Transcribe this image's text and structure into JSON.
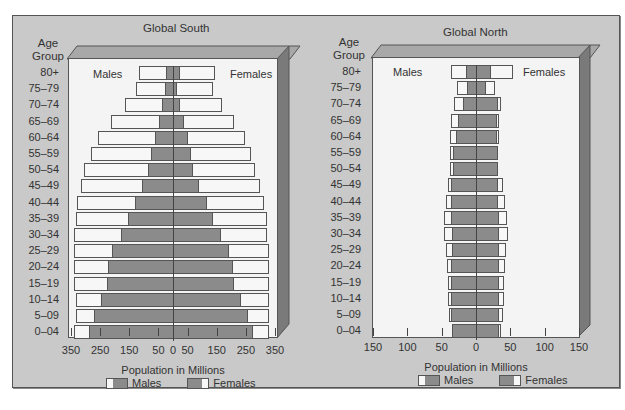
{
  "chart_data": [
    {
      "type": "bar",
      "subtype": "population-pyramid",
      "title": "Global South",
      "xlabel": "Population in Millions",
      "ylabel": "Age Group",
      "xlim": [
        -350,
        350
      ],
      "x_tick_labels": [
        "350",
        "250",
        "150",
        "50",
        "0",
        "50",
        "150",
        "250",
        "350"
      ],
      "x_tick_values": [
        -350,
        -250,
        -150,
        -50,
        0,
        50,
        150,
        250,
        350
      ],
      "grid": false,
      "side_labels": {
        "left": "Males",
        "right": "Females"
      },
      "legend": [
        "Males",
        "Females"
      ],
      "legend_position": "bottom",
      "categories": [
        "80+",
        "75-79",
        "70-74",
        "65-69",
        "60-64",
        "55-59",
        "50-54",
        "45-49",
        "40-44",
        "35-39",
        "30-34",
        "25-29",
        "20-24",
        "15-19",
        "10-14",
        "5-09",
        "0-04"
      ],
      "series": [
        {
          "name": "Males (outer, white)",
          "values": [
            116,
            126,
            164,
            212,
            259,
            280,
            307,
            314,
            328,
            334,
            338,
            338,
            341,
            341,
            334,
            334,
            341
          ]
        },
        {
          "name": "Males (inner, gray)",
          "values": [
            24,
            27,
            38,
            48,
            61,
            75,
            85,
            106,
            130,
            154,
            177,
            208,
            222,
            225,
            246,
            270,
            287
          ]
        },
        {
          "name": "Females (outer, white)",
          "values": [
            143,
            136,
            167,
            208,
            246,
            266,
            283,
            300,
            311,
            321,
            324,
            328,
            331,
            331,
            328,
            328,
            331
          ]
        },
        {
          "name": "Females (inner, gray)",
          "values": [
            24,
            14,
            24,
            38,
            51,
            61,
            68,
            89,
            116,
            136,
            164,
            191,
            205,
            208,
            232,
            259,
            273
          ]
        }
      ]
    },
    {
      "type": "bar",
      "subtype": "population-pyramid",
      "title": "Global North",
      "xlabel": "Population in Millions",
      "ylabel": "Age Group",
      "xlim": [
        -150,
        150
      ],
      "x_tick_labels": [
        "150",
        "100",
        "50",
        "0",
        "50",
        "100",
        "150"
      ],
      "x_tick_values": [
        -150,
        -100,
        -50,
        0,
        50,
        100,
        150
      ],
      "grid": false,
      "side_labels": {
        "left": "Males",
        "right": "Females"
      },
      "legend": [
        "Males",
        "Females"
      ],
      "legend_position": "bottom",
      "categories": [
        "80+",
        "75-79",
        "70-74",
        "65-69",
        "60-64",
        "55-59",
        "50-54",
        "45-49",
        "40-44",
        "35-39",
        "30-34",
        "25-29",
        "20-24",
        "15-19",
        "10-14",
        "5-09",
        "0-04"
      ],
      "series": [
        {
          "name": "Males (outer, white)",
          "values": [
            36,
            28,
            32,
            36,
            38,
            38,
            38,
            41,
            44,
            47,
            47,
            44,
            42,
            41,
            41,
            39,
            35
          ]
        },
        {
          "name": "Males (inner, gray)",
          "values": [
            15,
            13,
            19,
            26,
            29,
            33,
            33,
            36,
            36,
            36,
            35,
            35,
            36,
            36,
            36,
            36,
            35
          ]
        },
        {
          "name": "Females (outer, white)",
          "values": [
            54,
            28,
            36,
            33,
            33,
            32,
            32,
            39,
            42,
            45,
            47,
            44,
            42,
            41,
            41,
            39,
            36
          ]
        },
        {
          "name": "Females (inner, gray)",
          "values": [
            22,
            15,
            32,
            31,
            31,
            32,
            32,
            32,
            32,
            33,
            33,
            33,
            33,
            33,
            33,
            33,
            33
          ]
        }
      ]
    }
  ],
  "panels": {
    "south": {
      "title": "Global South",
      "age_header": [
        "Age",
        "Group"
      ],
      "males_label": "Males",
      "females_label": "Females",
      "xlabel": "Population in Millions",
      "legend_males": "Males",
      "legend_females": "Females"
    },
    "north": {
      "title": "Global North",
      "age_header": [
        "Age",
        "Group"
      ],
      "males_label": "Males",
      "females_label": "Females",
      "xlabel": "Population in Millions",
      "legend_males": "Males",
      "legend_females": "Females"
    }
  },
  "age_groups": [
    "80+",
    "75–79",
    "70–74",
    "65–69",
    "60–64",
    "55–59",
    "50–54",
    "45–49",
    "40–44",
    "35–39",
    "30–34",
    "25–29",
    "20–24",
    "15–19",
    "10–14",
    "5–09",
    "0–04"
  ],
  "colors": {
    "frame": "#c9c9c9",
    "plot": "#f4f4f4",
    "bar_gray": "#8b8b8b",
    "bar_white": "#f7f7f7",
    "side_face": "#7a7a7a",
    "top_face": "#a8a8a8"
  }
}
